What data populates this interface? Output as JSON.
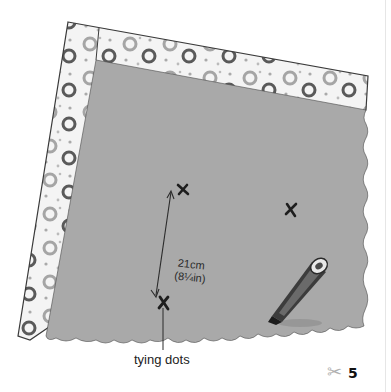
{
  "illustration": {
    "description": "Gray felt square laid on patterned fabric with two tying dots marked and a measurement",
    "colors": {
      "felt": "#a9a9a9",
      "fabric_bg": "#f4f4f4",
      "fabric_ring_dark": "#555555",
      "fabric_ring_light": "#9a9a9a",
      "outline": "#3a3a3a"
    },
    "measurement": {
      "metric": "21cm",
      "imperial": "(8¼in)"
    },
    "caption": "tying dots",
    "tool": "marker-pen"
  },
  "footer": {
    "icon": "scissors-icon",
    "page_number": "5"
  }
}
